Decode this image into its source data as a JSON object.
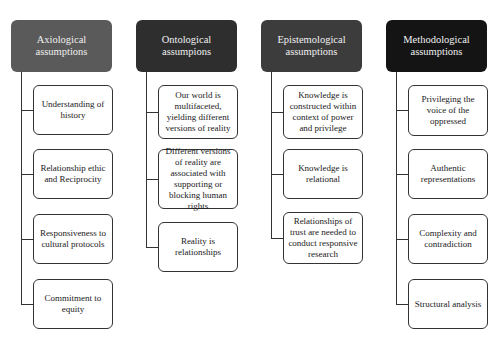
{
  "diagram": {
    "columns": [
      {
        "title": "Axiological assumptions",
        "header_color": "#5a5a5a",
        "items": [
          "Understanding of history",
          "Relationship ethic and Reciprocity",
          "Responsiveness to cultural protocols",
          "Commitment to equity"
        ]
      },
      {
        "title": "Ontological assumpions",
        "header_color": "#2e2e2e",
        "items": [
          "Our world is multifaceted, yielding different versions of reality",
          "Different versions of reality are associated with supporting or blocking human rights",
          "Reality is relationships"
        ]
      },
      {
        "title": "Epistemological assumptions",
        "header_color": "#3c3c3c",
        "items": [
          "Knowledge is constructed within context of power and privilege",
          "Knowledge is relational",
          "Relationships of trust are needed to conduct responsive research"
        ]
      },
      {
        "title": "Methodological assumptions",
        "header_color": "#141414",
        "items": [
          "Privileging the voice of the oppressed",
          "Authentic representations",
          "Complexity and contradiction",
          "Structural analysis"
        ]
      }
    ]
  }
}
